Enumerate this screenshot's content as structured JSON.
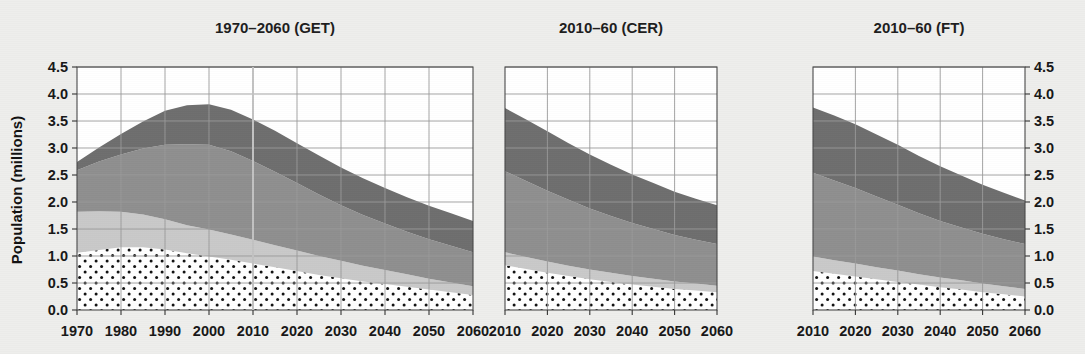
{
  "figure": {
    "ylabel": "Population (millions)",
    "y_ticks": [
      "0.0",
      "0.5",
      "1.0",
      "1.5",
      "2.0",
      "2.5",
      "3.0",
      "3.5",
      "4.0",
      "4.5"
    ],
    "y_values": [
      0.0,
      0.5,
      1.0,
      1.5,
      2.0,
      2.5,
      3.0,
      3.5,
      4.0,
      4.5
    ],
    "ylim": [
      0.0,
      4.5
    ],
    "grid": true,
    "background_color": "#eeeeec",
    "colors": {
      "band_dotted": "#ffffff",
      "band_dot_color": "#111111",
      "band_light": "#c9c9c9",
      "band_medium": "#8f8f8f",
      "band_dark": "#6e6e6e",
      "frame": "#4a4a4a",
      "grid": "#9a9a9a",
      "text": "#171717"
    }
  },
  "chart_data": [
    {
      "type": "area",
      "title": "1970–2060 (GET)",
      "xlabel": "",
      "ylabel": "Population (millions)",
      "ylim": [
        0.0,
        4.5
      ],
      "xlim": [
        1970,
        2060
      ],
      "grid": true,
      "legend": "none",
      "x": [
        1970,
        1975,
        1980,
        1985,
        1990,
        1995,
        2000,
        2005,
        2010,
        2015,
        2020,
        2025,
        2030,
        2035,
        2040,
        2045,
        2050,
        2055,
        2060
      ],
      "tick_labels": [
        "1970",
        "1980",
        "1990",
        "2000",
        "2010",
        "2020",
        "2030",
        "2040",
        "2050",
        "2060"
      ],
      "tick_values": [
        1970,
        1980,
        1990,
        2000,
        2010,
        2020,
        2030,
        2040,
        2050,
        2060
      ],
      "annotations": [
        "vertical reference line at 2010"
      ],
      "series": [
        {
          "name": "band-1-dotted",
          "style": "white-with-dots",
          "values": [
            1.06,
            1.11,
            1.16,
            1.16,
            1.12,
            1.05,
            0.99,
            0.93,
            0.86,
            0.79,
            0.72,
            0.65,
            0.59,
            0.53,
            0.48,
            0.43,
            0.38,
            0.33,
            0.28
          ]
        },
        {
          "name": "band-2-light",
          "style": "light-gray",
          "values": [
            0.76,
            0.72,
            0.66,
            0.61,
            0.56,
            0.52,
            0.5,
            0.47,
            0.44,
            0.41,
            0.38,
            0.35,
            0.32,
            0.29,
            0.26,
            0.23,
            0.2,
            0.18,
            0.16
          ]
        },
        {
          "name": "band-3-medium",
          "style": "medium-gray",
          "values": [
            0.77,
            0.92,
            1.06,
            1.22,
            1.38,
            1.5,
            1.57,
            1.54,
            1.46,
            1.36,
            1.25,
            1.14,
            1.03,
            0.94,
            0.86,
            0.79,
            0.73,
            0.68,
            0.63
          ]
        },
        {
          "name": "band-4-dark",
          "style": "dark-gray",
          "values": [
            0.15,
            0.26,
            0.38,
            0.5,
            0.63,
            0.72,
            0.75,
            0.77,
            0.77,
            0.76,
            0.74,
            0.72,
            0.7,
            0.68,
            0.66,
            0.64,
            0.62,
            0.6,
            0.58
          ]
        }
      ],
      "cumulative_top": [
        2.74,
        3.01,
        3.26,
        3.49,
        3.69,
        3.79,
        3.81,
        3.71,
        3.53,
        3.32,
        3.09,
        2.86,
        2.64,
        2.44,
        2.26,
        2.09,
        1.93,
        1.79,
        1.65
      ]
    },
    {
      "type": "area",
      "title": "2010–60 (CER)",
      "xlabel": "",
      "ylabel": "",
      "ylim": [
        0.0,
        4.5
      ],
      "xlim": [
        2010,
        2060
      ],
      "grid": true,
      "legend": "none",
      "x": [
        2010,
        2015,
        2020,
        2025,
        2030,
        2035,
        2040,
        2045,
        2050,
        2055,
        2060
      ],
      "tick_labels": [
        "2010",
        "2020",
        "2030",
        "2040",
        "2050",
        "2060"
      ],
      "tick_values": [
        2010,
        2020,
        2030,
        2040,
        2050,
        2060
      ],
      "annotations": [],
      "series": [
        {
          "name": "band-1-dotted",
          "style": "white-with-dots",
          "values": [
            0.83,
            0.76,
            0.69,
            0.63,
            0.57,
            0.52,
            0.47,
            0.43,
            0.39,
            0.36,
            0.33
          ]
        },
        {
          "name": "band-2-light",
          "style": "light-gray",
          "values": [
            0.24,
            0.22,
            0.21,
            0.19,
            0.18,
            0.17,
            0.16,
            0.15,
            0.14,
            0.13,
            0.12
          ]
        },
        {
          "name": "band-3-medium",
          "style": "medium-gray",
          "values": [
            1.5,
            1.41,
            1.31,
            1.22,
            1.13,
            1.05,
            0.98,
            0.92,
            0.86,
            0.81,
            0.77
          ]
        },
        {
          "name": "band-4-dark",
          "style": "dark-gray",
          "values": [
            1.17,
            1.14,
            1.1,
            1.05,
            1.0,
            0.95,
            0.9,
            0.85,
            0.8,
            0.76,
            0.72
          ]
        }
      ],
      "cumulative_top": [
        3.74,
        3.53,
        3.31,
        3.09,
        2.88,
        2.69,
        2.51,
        2.35,
        2.19,
        2.06,
        1.94
      ]
    },
    {
      "type": "area",
      "title": "2010–60 (FT)",
      "xlabel": "",
      "ylabel": "",
      "ylim": [
        0.0,
        4.5
      ],
      "xlim": [
        2010,
        2060
      ],
      "grid": true,
      "legend": "none",
      "x": [
        2010,
        2015,
        2020,
        2025,
        2030,
        2035,
        2040,
        2045,
        2050,
        2055,
        2060
      ],
      "tick_labels": [
        "2010",
        "2020",
        "2030",
        "2040",
        "2050",
        "2060"
      ],
      "tick_values": [
        2010,
        2020,
        2030,
        2040,
        2050,
        2060
      ],
      "annotations": [],
      "series": [
        {
          "name": "band-1-dotted",
          "style": "white-with-dots",
          "values": [
            0.72,
            0.67,
            0.62,
            0.57,
            0.52,
            0.47,
            0.42,
            0.38,
            0.33,
            0.29,
            0.25
          ]
        },
        {
          "name": "band-2-light",
          "style": "light-gray",
          "values": [
            0.27,
            0.25,
            0.24,
            0.22,
            0.21,
            0.19,
            0.18,
            0.17,
            0.16,
            0.15,
            0.14
          ]
        },
        {
          "name": "band-3-medium",
          "style": "medium-gray",
          "values": [
            1.55,
            1.48,
            1.4,
            1.31,
            1.22,
            1.13,
            1.05,
            0.98,
            0.92,
            0.87,
            0.83
          ]
        },
        {
          "name": "band-4-dark",
          "style": "dark-gray",
          "values": [
            1.21,
            1.2,
            1.18,
            1.15,
            1.11,
            1.06,
            1.01,
            0.96,
            0.91,
            0.86,
            0.81
          ]
        }
      ],
      "cumulative_top": [
        3.75,
        3.6,
        3.44,
        3.25,
        3.06,
        2.85,
        2.66,
        2.49,
        2.32,
        2.17,
        2.03
      ]
    }
  ]
}
